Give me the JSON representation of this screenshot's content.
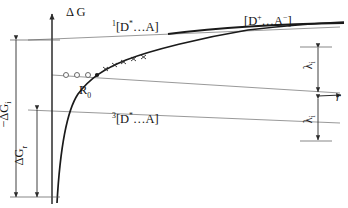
{
  "figure": {
    "type": "energy-level-diagram"
  },
  "axes": {
    "y_label": "Δ G",
    "y_label_parts": {
      "delta": "Δ",
      "g": "G"
    },
    "x_label": "r",
    "y_axis_x_px": 52,
    "x_axis_y_px": 97
  },
  "levels": [
    {
      "id": "singlet",
      "label_html": "<sup>1</sup>[D<sup>*</sup>…A]",
      "label_text": "1[D*...A]",
      "y_px": 40,
      "state": "singlet excited donor-acceptor pair"
    },
    {
      "id": "ion-pair",
      "label_html": "[D<sup>+</sup>…A<sup>−</sup>]",
      "label_text": "[D+...A-]",
      "y_px": 22,
      "state": "radical ion pair asymptote"
    },
    {
      "id": "crossing",
      "label_text": "",
      "y_px": 75,
      "state": "horizontal reference line through R0"
    },
    {
      "id": "triplet",
      "label_html": "<sup>3</sup>[D<sup>*</sup>…A]",
      "label_text": "3[D*...A]",
      "y_px": 110,
      "state": "triplet excited donor-acceptor pair"
    }
  ],
  "annotations": {
    "r0_label_html": "R<sub>0</sub>",
    "r0_label_text": "R0",
    "r0_x_px": 97,
    "r0_y_px": 75,
    "delta_g_i_html": "−ΔG<sub>i</sub>",
    "delta_g_i_text": "-ΔGi",
    "delta_g_r_html": "ΔG<sub>r</sub>",
    "delta_g_r_text": "ΔGr",
    "lambda_upper_html": "λ<sub>i</sub>",
    "lambda_lower_html": "λ<sub>i</sub>",
    "lambda_text": "λi"
  },
  "markers": {
    "open_circles": [
      {
        "x": 66,
        "y": 75
      },
      {
        "x": 77,
        "y": 75
      },
      {
        "x": 88,
        "y": 75
      }
    ],
    "crosses": [
      {
        "x": 106,
        "y": 68
      },
      {
        "x": 114,
        "y": 64
      },
      {
        "x": 122,
        "y": 61
      },
      {
        "x": 131,
        "y": 59
      },
      {
        "x": 140,
        "y": 57
      }
    ],
    "filled_point": {
      "x": 97,
      "y": 75
    }
  },
  "chart_data": {
    "type": "line",
    "title": "",
    "xlabel": "r",
    "ylabel": "Δ G",
    "grid": false,
    "legend": "none",
    "curve_name": "Coulombic ion-pair energy",
    "x": [
      57,
      59,
      62,
      66,
      71,
      78,
      86,
      97,
      110,
      126,
      145,
      168,
      195,
      225,
      260,
      300,
      340
    ],
    "y": [
      200,
      168,
      140,
      118,
      103,
      92,
      83,
      75,
      67,
      60,
      53,
      47,
      41,
      36,
      32,
      29,
      27
    ],
    "asymptote_y": 24
  },
  "colors": {
    "curve": "#1a1a1a",
    "level_line": "#8d8d8d",
    "axis": "#2b2b2b",
    "text": "#151515",
    "marker": "#3a3a3a"
  }
}
